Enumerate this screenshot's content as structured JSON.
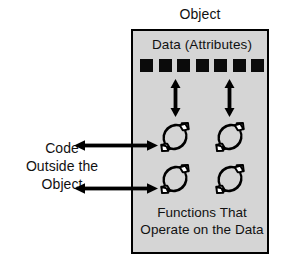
{
  "diagram": {
    "type": "object-encapsulation-diagram",
    "title": "Object",
    "colors": {
      "page_background": "#ffffff",
      "box_fill": "#d5d5d5",
      "box_border": "#000000",
      "attribute_square": "#0b0b0b",
      "arrow": "#000000",
      "text": "#111111"
    },
    "object_box": {
      "data_label": "Data (Attributes)",
      "attributes": {
        "count": 7,
        "icon": "filled-square"
      },
      "data_to_function_arrows": {
        "count": 2,
        "icon": "double-headed-vertical-arrow"
      },
      "functions": {
        "count": 4,
        "icon": "circular-arrow",
        "rows": 2,
        "columns": 2
      },
      "functions_caption_lines": [
        "Functions That",
        "Operate on the Data"
      ]
    },
    "external": {
      "code_label_lines": [
        "Code",
        "Outside the",
        "Object"
      ],
      "connector_arrows": {
        "count": 2,
        "icon": "double-headed-horizontal-arrow"
      }
    }
  }
}
